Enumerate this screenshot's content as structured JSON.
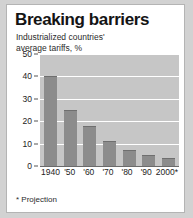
{
  "card": {
    "title": "Breaking barriers",
    "subtitle_line1": "Industrialized countries'",
    "subtitle_line2": "average tariffs, %",
    "footnote": "* Projection"
  },
  "colors": {
    "bar": "#8c8c8c",
    "plot_background": "#c6c6c6",
    "gridline": "#ffffff",
    "card_background": "#ffffff",
    "page_background": "#d2d2d2",
    "text": "#141414"
  },
  "chart_data": {
    "type": "bar",
    "title": "Breaking barriers",
    "subtitle": "Industrialized countries' average tariffs, %",
    "categories": [
      "1940",
      "'50",
      "'60",
      "'70",
      "'80",
      "'90",
      "2000*"
    ],
    "values": [
      40,
      25,
      18,
      11,
      7,
      5,
      3.5
    ],
    "xlabel": "",
    "ylabel": "",
    "ylim": [
      0,
      50
    ],
    "yticks": [
      0,
      10,
      20,
      30,
      40,
      50
    ],
    "ytick_labels": [
      "0",
      "10",
      "20",
      "30",
      "40",
      "50"
    ],
    "grid": true,
    "legend": "none",
    "annotations": [
      "* Projection"
    ]
  }
}
